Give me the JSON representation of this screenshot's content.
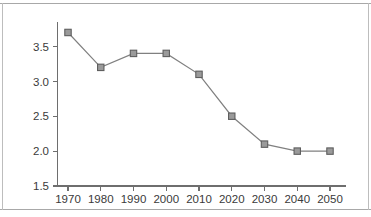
{
  "chart_data": {
    "type": "line",
    "title": "",
    "subtitle": "",
    "xlabel": "",
    "ylabel": "",
    "categories": [
      "1970",
      "1980",
      "1990",
      "2000",
      "2010",
      "2020",
      "2030",
      "2040",
      "2050"
    ],
    "x": [
      1970,
      1980,
      1990,
      2000,
      2010,
      2020,
      2030,
      2040,
      2050
    ],
    "values": [
      3.7,
      3.2,
      3.4,
      3.4,
      3.1,
      2.5,
      2.1,
      2.0,
      2.0
    ],
    "series": [
      {
        "name": "",
        "values": [
          3.7,
          3.2,
          3.4,
          3.4,
          3.1,
          2.5,
          2.1,
          2.0,
          2.0
        ],
        "marker": "square",
        "marker_color": "#9a9a9a",
        "marker_edge_color": "#5e5e5e",
        "line_color": "#808080"
      }
    ],
    "xlim": [
      1965,
      2055
    ],
    "ylim": [
      1.5,
      3.85
    ],
    "ytick_labels": [
      "1.5",
      "2.0",
      "2.5",
      "3.0",
      "3.5"
    ],
    "yticks": [
      1.5,
      2.0,
      2.5,
      3.0,
      3.5
    ],
    "xtick_labels": [
      "1970",
      "1980",
      "1990",
      "2000",
      "2010",
      "2020",
      "2030",
      "2040",
      "2050"
    ],
    "xticks": [
      1970,
      1980,
      1990,
      2000,
      2010,
      2020,
      2030,
      2040,
      2050
    ],
    "grid": false,
    "legend": null,
    "legend_position": "none",
    "annotations": []
  },
  "figure": {
    "background_color": "#ffffff",
    "border_color": "#a8a8a8",
    "axis_color": "#6e6e6e",
    "text_color": "#3a3a3a"
  }
}
